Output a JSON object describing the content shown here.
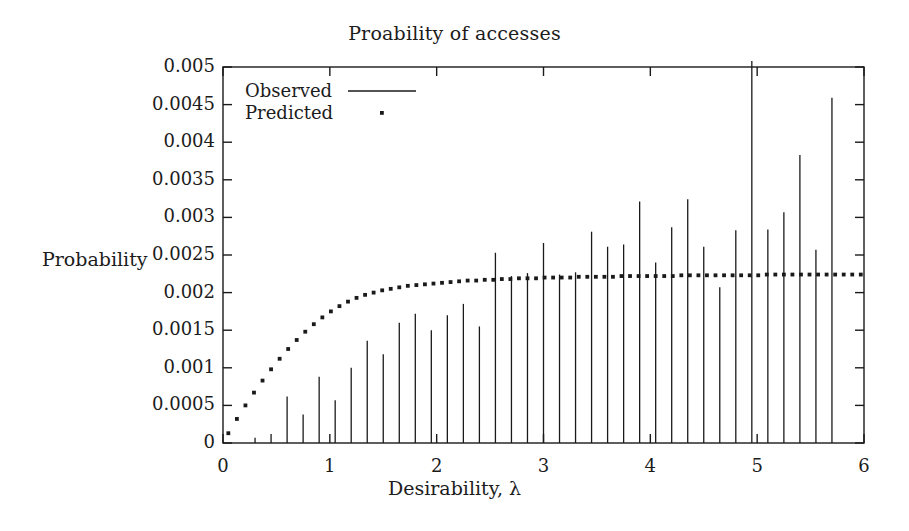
{
  "chart_data": {
    "type": "bar",
    "title": "Proability of accesses",
    "xlabel": "Desirability, λ",
    "ylabel": "Probability",
    "xlim": [
      0,
      6
    ],
    "ylim": [
      0,
      0.005
    ],
    "grid": false,
    "legend_position": "top-left inside",
    "xticks": [
      0,
      1,
      2,
      3,
      4,
      5,
      6
    ],
    "xtick_labels": [
      "0",
      "1",
      "2",
      "3",
      "4",
      "5",
      "6"
    ],
    "yticks": [
      0,
      0.0005,
      0.001,
      0.0015,
      0.002,
      0.0025,
      0.003,
      0.0035,
      0.004,
      0.0045,
      0.005
    ],
    "ytick_labels": [
      "0",
      "0.0005",
      "0.001",
      "0.0015",
      "0.002",
      "0.0025",
      "0.003",
      "0.0035",
      "0.004",
      "0.0045",
      "0.005"
    ],
    "series": [
      {
        "name": "Observed",
        "style": "impulses",
        "marker": "line",
        "x": [
          0.3,
          0.45,
          0.6,
          0.75,
          0.9,
          1.05,
          1.2,
          1.35,
          1.5,
          1.65,
          1.8,
          1.95,
          2.1,
          2.25,
          2.4,
          2.55,
          2.7,
          2.85,
          3.0,
          3.15,
          3.3,
          3.45,
          3.6,
          3.75,
          3.9,
          4.05,
          4.2,
          4.35,
          4.5,
          4.65,
          4.8,
          4.95,
          5.1,
          5.25,
          5.4,
          5.55,
          5.7
        ],
        "values": [
          7e-05,
          0.00012,
          0.00062,
          0.00038,
          0.00088,
          0.00057,
          0.001,
          0.00136,
          0.00118,
          0.0016,
          0.00172,
          0.0015,
          0.0017,
          0.00185,
          0.00155,
          0.00253,
          0.00222,
          0.00226,
          0.00266,
          0.00224,
          0.00227,
          0.00281,
          0.00261,
          0.00264,
          0.00321,
          0.0024,
          0.00287,
          0.00324,
          0.00261,
          0.00207,
          0.00283,
          0.0052,
          0.00284,
          0.00307,
          0.00383,
          0.00257,
          0.00459
        ]
      },
      {
        "name": "Predicted",
        "style": "dots",
        "marker": "dot",
        "x": [
          0.05,
          0.13,
          0.21,
          0.29,
          0.37,
          0.45,
          0.53,
          0.61,
          0.69,
          0.77,
          0.85,
          0.93,
          1.01,
          1.09,
          1.17,
          1.25,
          1.33,
          1.41,
          1.49,
          1.57,
          1.65,
          1.73,
          1.81,
          1.89,
          1.97,
          2.05,
          2.13,
          2.21,
          2.29,
          2.37,
          2.45,
          2.53,
          2.61,
          2.69,
          2.77,
          2.85,
          2.93,
          3.01,
          3.09,
          3.17,
          3.25,
          3.33,
          3.41,
          3.49,
          3.57,
          3.65,
          3.73,
          3.81,
          3.89,
          3.97,
          4.05,
          4.13,
          4.21,
          4.29,
          4.37,
          4.45,
          4.53,
          4.61,
          4.69,
          4.77,
          4.85,
          4.93,
          5.01,
          5.09,
          5.17,
          5.25,
          5.33,
          5.41,
          5.49,
          5.57,
          5.65,
          5.73,
          5.81,
          5.89,
          5.97
        ],
        "values": [
          0.00013,
          0.00032,
          0.0005,
          0.00067,
          0.00083,
          0.00098,
          0.00112,
          0.00125,
          0.00137,
          0.00148,
          0.00158,
          0.00167,
          0.00175,
          0.00182,
          0.00188,
          0.00193,
          0.00197,
          0.002,
          0.00203,
          0.00205,
          0.00207,
          0.00209,
          0.0021,
          0.00211,
          0.00212,
          0.00213,
          0.00214,
          0.00215,
          0.00216,
          0.00216,
          0.00217,
          0.00217,
          0.00218,
          0.00218,
          0.00219,
          0.00219,
          0.00219,
          0.0022,
          0.0022,
          0.0022,
          0.0022,
          0.00221,
          0.00221,
          0.00221,
          0.00221,
          0.00221,
          0.00222,
          0.00222,
          0.00222,
          0.00222,
          0.00222,
          0.00222,
          0.00222,
          0.00223,
          0.00223,
          0.00223,
          0.00223,
          0.00223,
          0.00223,
          0.00223,
          0.00223,
          0.00223,
          0.00223,
          0.00224,
          0.00224,
          0.00224,
          0.00224,
          0.00224,
          0.00224,
          0.00224,
          0.00224,
          0.00224,
          0.00224,
          0.00224,
          0.00224
        ]
      }
    ]
  },
  "colors": {
    "axis": "#1a1a1a",
    "observed": "#1a1a1a",
    "predicted": "#1a1a1a",
    "background": "#ffffff"
  },
  "legend": {
    "observed_label": "Observed",
    "predicted_label": "Predicted"
  }
}
